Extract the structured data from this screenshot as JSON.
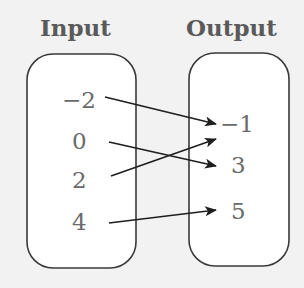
{
  "diagram": {
    "type": "mapping-diagram",
    "input_title": "Input",
    "output_title": "Output",
    "inputs": [
      "−2",
      "0",
      "2",
      "4"
    ],
    "outputs": [
      "−1",
      "3",
      "5"
    ],
    "mappings": [
      {
        "from": "−2",
        "to": "−1"
      },
      {
        "from": "0",
        "to": "3"
      },
      {
        "from": "2",
        "to": "−1"
      },
      {
        "from": "4",
        "to": "5"
      }
    ],
    "colors": {
      "background": "#f2f2f2",
      "box_fill": "#ffffff",
      "box_stroke": "#3a3a3a",
      "arrow": "#1e1e1e",
      "title_text": "#5a5a5a",
      "value_text": "#6a6a6a"
    }
  }
}
